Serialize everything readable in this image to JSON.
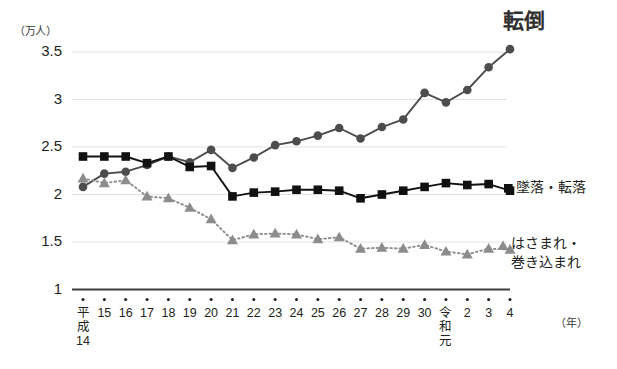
{
  "chart_data": {
    "type": "line",
    "title": "",
    "xlabel": "（年）",
    "ylabel": "（万人）",
    "ylim": [
      1,
      3.5
    ],
    "yticks": [
      "1",
      "1.5",
      "2",
      "2.5",
      "3",
      "3.5"
    ],
    "ytick_values": [
      1,
      1.5,
      2,
      2.5,
      3,
      3.5
    ],
    "grid": true,
    "legend_position": "right-inline",
    "categories": [
      "平成14",
      "15",
      "16",
      "17",
      "18",
      "19",
      "20",
      "21",
      "22",
      "23",
      "24",
      "25",
      "26",
      "27",
      "28",
      "29",
      "30",
      "令和元",
      "2",
      "3",
      "4"
    ],
    "category_labels_multiline": {
      "0": [
        "平",
        "成",
        "14"
      ],
      "17": [
        "令",
        "和",
        "元"
      ]
    },
    "series": [
      {
        "name": "転倒",
        "marker": "circle",
        "color": "#4d4d4d",
        "linestyle": "solid",
        "label_position": "top-right",
        "values": [
          2.08,
          2.22,
          2.24,
          2.31,
          2.4,
          2.34,
          2.47,
          2.28,
          2.39,
          2.52,
          2.56,
          2.62,
          2.7,
          2.59,
          2.71,
          2.79,
          3.07,
          2.97,
          3.1,
          3.34,
          3.53
        ]
      },
      {
        "name": "墜落・転落",
        "marker": "square",
        "color": "#111111",
        "linestyle": "solid",
        "label_position": "right",
        "values": [
          2.4,
          2.4,
          2.4,
          2.33,
          2.4,
          2.29,
          2.3,
          1.98,
          2.02,
          2.03,
          2.05,
          2.05,
          2.04,
          1.96,
          2.0,
          2.04,
          2.08,
          2.12,
          2.1,
          2.11,
          2.04
        ]
      },
      {
        "name": "はさまれ・\n巻き込まれ",
        "name_lines": [
          "はさまれ・",
          "巻き込まれ"
        ],
        "marker": "triangle",
        "color": "#8c8c8c",
        "linestyle": "dotted",
        "label_position": "right",
        "values": [
          2.17,
          2.12,
          2.15,
          1.98,
          1.96,
          1.86,
          1.74,
          1.52,
          1.58,
          1.59,
          1.58,
          1.53,
          1.55,
          1.43,
          1.44,
          1.43,
          1.47,
          1.4,
          1.37,
          1.43,
          1.42
        ]
      }
    ]
  },
  "axis": {
    "y_unit": "（万人）",
    "x_unit": "（年）"
  },
  "labels": {
    "series_fall": "転倒",
    "series_drop": "墜落・転落",
    "series_caught_line1": "はさまれ・",
    "series_caught_line2": "巻き込まれ"
  },
  "colors": {
    "fall": "#4d4d4d",
    "drop": "#111111",
    "caught": "#8c8c8c",
    "grid": "#e3e3e3",
    "axis": "#3f3f3f",
    "text": "#231f20"
  }
}
